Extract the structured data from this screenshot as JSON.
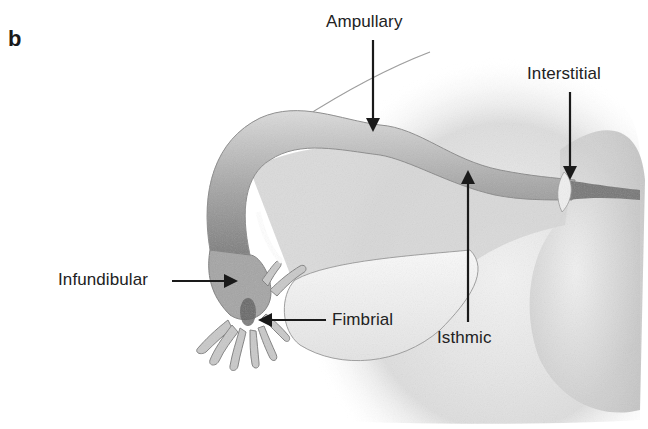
{
  "figure": {
    "panel_letter": "b",
    "labels": [
      {
        "id": "ampullary",
        "text": "Ampullary"
      },
      {
        "id": "interstitial",
        "text": "Interstitial"
      },
      {
        "id": "infundibular",
        "text": "Infundibular"
      },
      {
        "id": "fimbrial",
        "text": "Fimbrial"
      },
      {
        "id": "isthmic",
        "text": "Isthmic"
      }
    ],
    "colors": {
      "background": "#ffffff",
      "text": "#222222",
      "arrow": "#1a1a1a",
      "tissue_light": "#e6e6e6",
      "tissue_mid": "#b5b5b5",
      "tissue_dark": "#6e6e6e"
    }
  }
}
